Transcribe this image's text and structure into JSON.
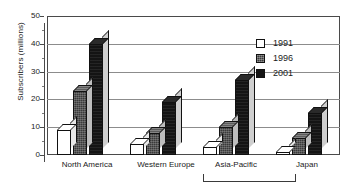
{
  "chart_data": {
    "type": "bar",
    "title": "",
    "subtitle": "",
    "xlabel": "",
    "ylabel": "Subscribers (millions)",
    "ylim": [
      0,
      50
    ],
    "ytick_labels": [
      "0",
      "10",
      "20",
      "30",
      "40",
      "50"
    ],
    "ytick_values": [
      0,
      10,
      20,
      30,
      40,
      50
    ],
    "grid": true,
    "grid_axis": "y",
    "legend_position": "upper-right",
    "three_d": true,
    "categories": [
      "North America",
      "Western Europe",
      "Asia-Pacific",
      "Japan"
    ],
    "series": [
      {
        "name": "1991",
        "color": "#ffffff",
        "values": [
          9,
          4,
          3,
          1
        ]
      },
      {
        "name": "1996",
        "color": "#3a3a3a",
        "values": [
          23,
          8,
          10,
          6
        ]
      },
      {
        "name": "2001",
        "color": "#141414",
        "values": [
          40,
          19,
          27,
          15
        ]
      }
    ],
    "annotations": [
      {
        "type": "bracket",
        "label": "",
        "spans": [
          "Asia-Pacific",
          "Japan"
        ]
      }
    ]
  },
  "legend": {
    "items": [
      {
        "label": "1991",
        "swatch": "swatch-white"
      },
      {
        "label": "1996",
        "swatch": "swatch-gray-hatched"
      },
      {
        "label": "2001",
        "swatch": "swatch-black"
      }
    ]
  },
  "axes": {
    "y_title": "Subscribers (millions)",
    "y_ticks": [
      "50",
      "40",
      "30",
      "20",
      "10",
      "0"
    ],
    "x_labels": [
      "North America",
      "Western  Europe",
      "Asia-Pacific",
      "Japan"
    ]
  },
  "colors": {
    "bar_1991": "#ffffff",
    "bar_1996": "#3a3a3a",
    "bar_2001": "#141414",
    "gridline": "#8c8c8c",
    "frame": "#4a4a4a",
    "text": "#1a1a1a"
  }
}
